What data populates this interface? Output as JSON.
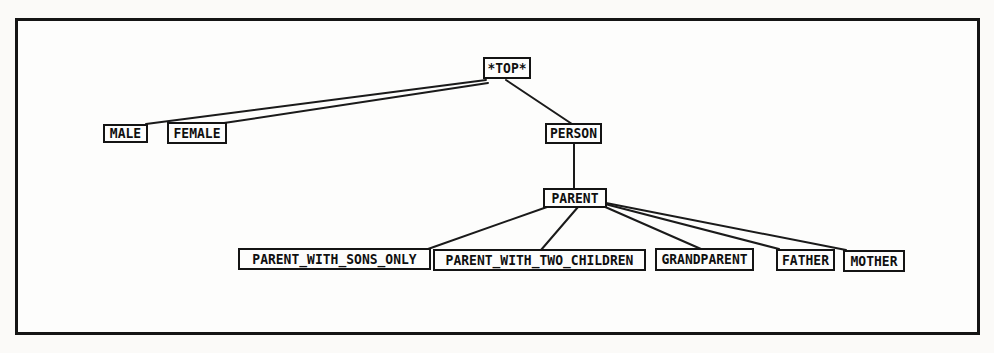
{
  "diagram": {
    "colors": {
      "background": "#fdfdfc",
      "frame_border": "#151515",
      "node_border": "#141414",
      "node_fill": "#fdfdfc",
      "edge": "#1a1a1a",
      "text": "#101010"
    },
    "nodes": [
      {
        "id": "top",
        "label": "*TOP*",
        "x": 483,
        "y": 57,
        "w": 48,
        "h": 22
      },
      {
        "id": "male",
        "label": "MALE",
        "x": 103,
        "y": 124,
        "w": 45,
        "h": 19
      },
      {
        "id": "female",
        "label": "FEMALE",
        "x": 167,
        "y": 122,
        "w": 60,
        "h": 22
      },
      {
        "id": "person",
        "label": "PERSON",
        "x": 545,
        "y": 123,
        "w": 57,
        "h": 21
      },
      {
        "id": "parent",
        "label": "PARENT",
        "x": 543,
        "y": 188,
        "w": 64,
        "h": 20
      },
      {
        "id": "pwso",
        "label": "PARENT_WITH_SONS_ONLY",
        "x": 238,
        "y": 248,
        "w": 193,
        "h": 22
      },
      {
        "id": "pwtc",
        "label": "PARENT_WITH_TWO_CHILDREN",
        "x": 433,
        "y": 249,
        "w": 213,
        "h": 22
      },
      {
        "id": "grandparent",
        "label": "GRANDPARENT",
        "x": 655,
        "y": 248,
        "w": 99,
        "h": 23
      },
      {
        "id": "father",
        "label": "FATHER",
        "x": 776,
        "y": 249,
        "w": 59,
        "h": 22
      },
      {
        "id": "mother",
        "label": "MOTHER",
        "x": 843,
        "y": 250,
        "w": 62,
        "h": 22
      }
    ],
    "edges": [
      {
        "from": "top",
        "to": "male",
        "x1": 486,
        "y1": 80,
        "x2": 146,
        "y2": 124
      },
      {
        "from": "top",
        "to": "female",
        "x1": 488,
        "y1": 83,
        "x2": 224,
        "y2": 123
      },
      {
        "from": "top",
        "to": "person",
        "x1": 506,
        "y1": 80,
        "x2": 572,
        "y2": 124
      },
      {
        "from": "person",
        "to": "parent",
        "x1": 574,
        "y1": 144,
        "x2": 574,
        "y2": 188
      },
      {
        "from": "parent",
        "to": "pwso",
        "x1": 547,
        "y1": 207,
        "x2": 428,
        "y2": 249
      },
      {
        "from": "parent",
        "to": "pwtc",
        "x1": 578,
        "y1": 207,
        "x2": 541,
        "y2": 250
      },
      {
        "from": "parent",
        "to": "grandparent",
        "x1": 603,
        "y1": 206,
        "x2": 701,
        "y2": 249
      },
      {
        "from": "parent",
        "to": "father",
        "x1": 605,
        "y1": 204,
        "x2": 779,
        "y2": 249
      },
      {
        "from": "parent",
        "to": "mother",
        "x1": 606,
        "y1": 203,
        "x2": 846,
        "y2": 250
      }
    ]
  }
}
